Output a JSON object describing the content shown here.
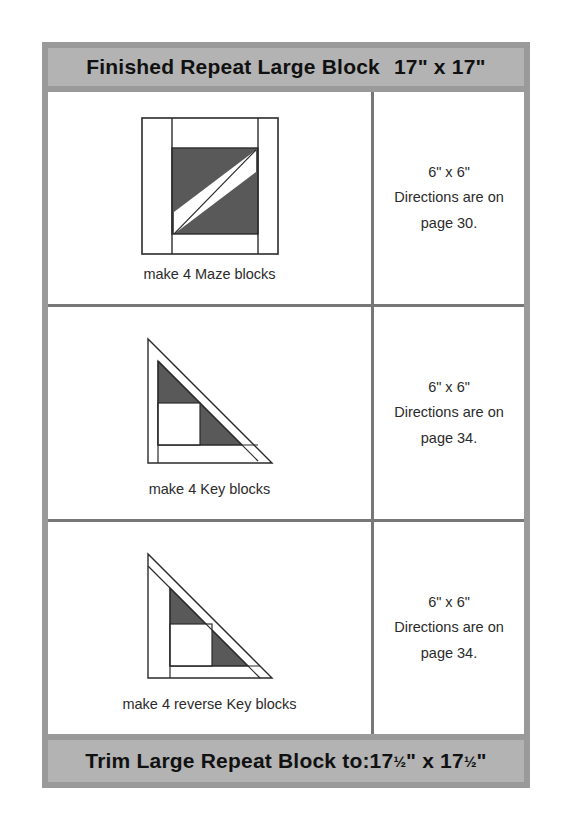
{
  "header": {
    "title": "Finished Repeat Large Block",
    "size": "17\" x 17\""
  },
  "footer": {
    "label": "Trim Large Repeat Block to:17",
    "fraction_1": "½",
    "middle": "\" x 17",
    "fraction_2": "½",
    "end": "\""
  },
  "colors": {
    "frame": "#9a9a9a",
    "banner_fill": "#b3b3b3",
    "grid_line": "#777777",
    "fabric_dark": "#595959",
    "fabric_light": "#ffffff",
    "patch_outline": "#2b2b2b",
    "text": "#2b2b2b"
  },
  "rows": [
    {
      "block_name": "maze-block",
      "caption": "make 4 Maze blocks",
      "info": {
        "size": "6\" x 6\"",
        "directions": "Directions are on",
        "page": "page 30."
      }
    },
    {
      "block_name": "key-block",
      "caption": "make 4 Key blocks",
      "info": {
        "size": "6\" x 6\"",
        "directions": "Directions are on",
        "page": "page 34."
      }
    },
    {
      "block_name": "reverse-key-block",
      "caption": "make 4 reverse Key blocks",
      "info": {
        "size": "6\" x 6\"",
        "directions": "Directions are on",
        "page": "page 34."
      }
    }
  ]
}
